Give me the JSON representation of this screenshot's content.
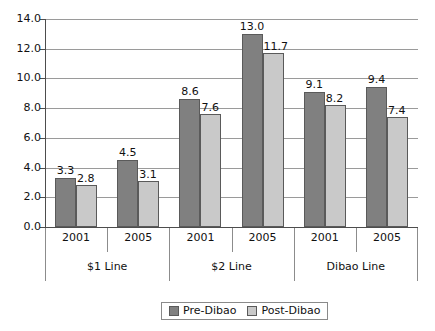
{
  "chart_data": {
    "type": "bar",
    "title": "",
    "xlabel": "",
    "ylabel": "",
    "ylim": [
      0.0,
      14.0
    ],
    "ytick_step": 2.0,
    "ytick_labels": [
      "0.0",
      "2.0",
      "4.0",
      "6.0",
      "8.0",
      "10.0",
      "12.0",
      "14.0"
    ],
    "grid": true,
    "legend_position": "bottom-center",
    "group_labels": [
      "$1 Line",
      "$2 Line",
      "Dibao Line"
    ],
    "categories": [
      "2001",
      "2005",
      "2001",
      "2005",
      "2001",
      "2005"
    ],
    "series": [
      {
        "name": "Pre-Dibao",
        "color": "#808080",
        "values": [
          3.3,
          4.5,
          8.6,
          13.0,
          9.1,
          9.4
        ],
        "labels": [
          "3.3",
          "4.5",
          "8.6",
          "13.0",
          "9.1",
          "9.4"
        ]
      },
      {
        "name": "Post-Dibao",
        "color": "#c9c9c9",
        "values": [
          2.8,
          3.1,
          7.6,
          11.7,
          8.2,
          7.4
        ],
        "labels": [
          "2.8",
          "3.1",
          "7.6",
          "11.7",
          "8.2",
          "7.4"
        ]
      }
    ]
  },
  "legend": {
    "items": [
      {
        "label": "Pre-Dibao"
      },
      {
        "label": "Post-Dibao"
      }
    ]
  },
  "axis": {
    "y_ticks": [
      "14.0",
      "12.0",
      "10.0",
      "8.0",
      "6.0",
      "4.0",
      "2.0",
      "0.0"
    ]
  }
}
